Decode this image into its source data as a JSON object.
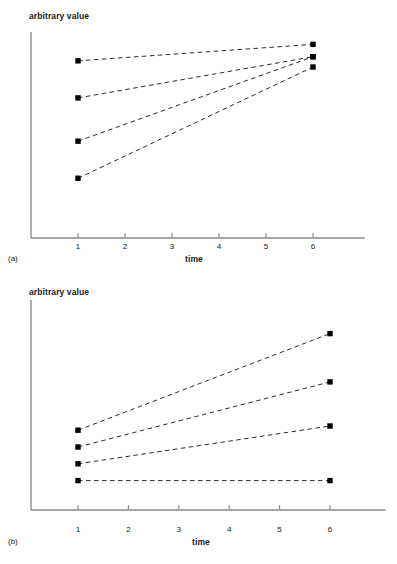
{
  "chart_data": [
    {
      "type": "line",
      "panel": "(a)",
      "title": "",
      "xlabel": "time",
      "ylabel": "arbitrary value",
      "grid": false,
      "legend": "none",
      "linestyle": "dashed",
      "marker": "filled-square",
      "marker_color": "#000000",
      "axis_color": "#8a8a8a",
      "x": [
        1,
        6
      ],
      "xticks": [
        1,
        2,
        3,
        4,
        5,
        6
      ],
      "xlim": [
        0.55,
        7.1
      ],
      "ylim": [
        0,
        100
      ],
      "series": [
        {
          "name": "series-1",
          "values": [
            86,
            94
          ]
        },
        {
          "name": "series-2",
          "values": [
            68,
            88
          ]
        },
        {
          "name": "series-3",
          "values": [
            47,
            88
          ]
        },
        {
          "name": "series-4",
          "values": [
            29,
            83
          ]
        }
      ]
    },
    {
      "type": "line",
      "panel": "(b)",
      "title": "",
      "xlabel": "time",
      "ylabel": "arbitrary value",
      "grid": false,
      "legend": "none",
      "linestyle": "dashed",
      "marker": "filled-square",
      "marker_color": "#000000",
      "axis_color": "#8a8a8a",
      "x": [
        1,
        6
      ],
      "xticks": [
        1,
        2,
        3,
        4,
        5,
        6
      ],
      "xlim": [
        0.55,
        7.1
      ],
      "ylim": [
        0,
        100
      ],
      "series": [
        {
          "name": "series-1",
          "values": [
            38,
            84
          ]
        },
        {
          "name": "series-2",
          "values": [
            30,
            61
          ]
        },
        {
          "name": "series-3",
          "values": [
            22,
            40
          ]
        },
        {
          "name": "series-4",
          "values": [
            14,
            14
          ]
        }
      ]
    }
  ],
  "panels": {
    "a": {
      "label": "(a)",
      "ylabel": "arbitrary value",
      "xlabel": "time",
      "ticks": [
        "1",
        "2",
        "3",
        "4",
        "5",
        "6"
      ]
    },
    "b": {
      "label": "(b)",
      "ylabel": "arbitrary value",
      "xlabel": "time",
      "ticks": [
        "1",
        "2",
        "3",
        "4",
        "5",
        "6"
      ]
    }
  }
}
